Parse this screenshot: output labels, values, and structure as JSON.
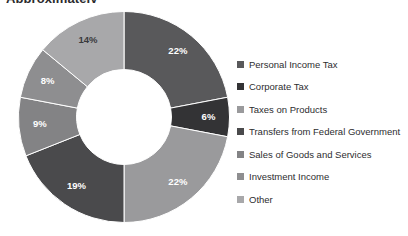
{
  "title": "Approximately",
  "chart_data": {
    "type": "pie",
    "variant": "donut",
    "title": "Approximately",
    "xlabel": "",
    "ylabel": "",
    "legend_position": "right",
    "grid": false,
    "units": "percent",
    "start_angle_deg": 0,
    "direction": "clockwise",
    "inner_radius_ratio": 0.45,
    "categories": [
      "Personal Income Tax",
      "Corporate Tax",
      "Taxes on Products",
      "Transfers from Federal Government",
      "Sales of Goods and Services",
      "Investment Income",
      "Other"
    ],
    "values": [
      22,
      6,
      22,
      19,
      9,
      8,
      14
    ],
    "data_labels": [
      "22%",
      "6%",
      "22%",
      "19%",
      "9%",
      "8%",
      "14%"
    ],
    "colors": [
      "#59595b",
      "#333335",
      "#9a9a9c",
      "#4a4a4c",
      "#838385",
      "#8e8e90",
      "#a8a8aa"
    ],
    "label_text_colors": [
      "#ffffff",
      "#ffffff",
      "#ffffff",
      "#ffffff",
      "#ffffff",
      "#ffffff",
      "#3a3a3c"
    ]
  },
  "legend": {
    "items": [
      {
        "label": "Personal Income Tax",
        "color": "#59595b"
      },
      {
        "label": "Corporate Tax",
        "color": "#333335"
      },
      {
        "label": "Taxes on Products",
        "color": "#9a9a9c"
      },
      {
        "label": "Transfers from Federal Government",
        "color": "#4a4a4c"
      },
      {
        "label": "Sales of Goods and Services",
        "color": "#838385"
      },
      {
        "label": "Investment Income",
        "color": "#8e8e90"
      },
      {
        "label": "Other",
        "color": "#a8a8aa"
      }
    ]
  }
}
